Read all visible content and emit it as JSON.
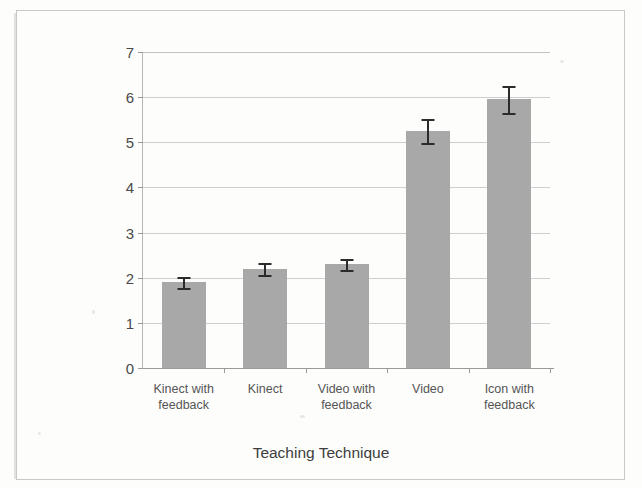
{
  "chart_data": {
    "type": "bar",
    "title": "",
    "xlabel": "Teaching Technique",
    "ylabel": "Avg. Converging Gesture Count",
    "categories": [
      "Kinect with\nfeedback",
      "Kinect",
      "Video with\nfeedback",
      "Video",
      "Icon with\nfeedback"
    ],
    "values": [
      1.9,
      2.2,
      2.3,
      5.25,
      5.95
    ],
    "errors": [
      0.12,
      0.13,
      0.12,
      0.27,
      0.3
    ],
    "ylim": [
      0,
      7
    ],
    "yticks": [
      0,
      1,
      2,
      3,
      4,
      5,
      6,
      7
    ],
    "ytick_labels": [
      "0",
      "1",
      "2",
      "3",
      "4",
      "5",
      "6",
      "7"
    ],
    "grid": true,
    "legend": "none",
    "bar_color": "#a8a8a8",
    "error_color": "#2b2b2b",
    "gridline_color": "#cfcfcf",
    "axis_color": "#9a9a9a"
  }
}
